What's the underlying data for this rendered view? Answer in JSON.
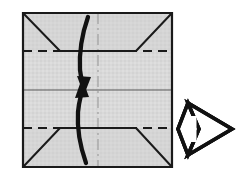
{
  "figure": {
    "title": "Origami fold diagram step",
    "description": "Square sheet of paper with four corners folded toward the horizontal crease lines, two curved arrows indicating folding the top and bottom edges toward the center, and a hollow outline arrow at right indicating proceed to next step.",
    "canvas": {
      "width": 245,
      "height": 184,
      "background": "#ffffff"
    }
  },
  "colors": {
    "paper_fill": "#d7d7d7",
    "paper_shadow": "#c9c9c9",
    "outline": "#1a1a1a",
    "crease_solid": "#3c3c3c",
    "crease_dashed": "#1a1a1a",
    "center_line": "#9a9a9a",
    "arrow_stroke": "#111111",
    "arrow_fill_hollow": "#ffffff",
    "background": "#ffffff"
  },
  "paper": {
    "name": "folded-square-sheet",
    "corners": {
      "top_left": [
        23,
        13
      ],
      "top_right": [
        172,
        13
      ],
      "bottom_right": [
        172,
        167
      ],
      "bottom_left": [
        23,
        167
      ]
    },
    "outline_width": 2.2
  },
  "creases": {
    "horizontal_dashed_upper": {
      "y": 51,
      "x_start": 23,
      "x_end": 172,
      "style": "dashed",
      "label": "upper-valley-crease"
    },
    "horizontal_dashed_lower": {
      "y": 128,
      "x_start": 23,
      "x_end": 172,
      "style": "dashed",
      "label": "lower-valley-crease"
    },
    "horizontal_solid_center": {
      "y": 90,
      "x_start": 23,
      "x_end": 172,
      "style": "solid-thin",
      "label": "center-horizontal-crease"
    },
    "vertical_center": {
      "x": 98,
      "y_start": 13,
      "y_end": 167,
      "style": "dash-dot",
      "label": "center-vertical-axis"
    }
  },
  "corner_folds": [
    {
      "name": "fold-flap-top-left",
      "from": [
        23,
        13
      ],
      "to": [
        60,
        51
      ]
    },
    {
      "name": "fold-flap-top-right",
      "from": [
        172,
        13
      ],
      "to": [
        136,
        51
      ]
    },
    {
      "name": "fold-flap-bottom-left",
      "from": [
        23,
        167
      ],
      "to": [
        60,
        128
      ]
    },
    {
      "name": "fold-flap-bottom-right",
      "from": [
        172,
        167
      ],
      "to": [
        136,
        128
      ]
    }
  ],
  "motion_arrows": [
    {
      "name": "fold-down-arrow",
      "direction": "down",
      "description": "Thick curved arrow from top edge curving down to the center, arrowhead pointing down",
      "start": [
        88,
        17
      ],
      "end": [
        84,
        90
      ],
      "stroke_width": 4.2
    },
    {
      "name": "fold-up-arrow",
      "direction": "up",
      "description": "Thick curved arrow from bottom edge curving up to the center, arrowhead pointing up",
      "start": [
        86,
        163
      ],
      "end": [
        84,
        84
      ],
      "stroke_width": 4.2
    }
  ],
  "next_step_arrow": {
    "name": "next-step-arrow",
    "shape": "hollow-right-chevron-arrow",
    "direction": "right",
    "bounds": {
      "x": 178,
      "y": 103,
      "width": 54,
      "height": 52
    },
    "fill": "#ffffff",
    "stroke": "#111111",
    "stroke_width": 3.4
  }
}
